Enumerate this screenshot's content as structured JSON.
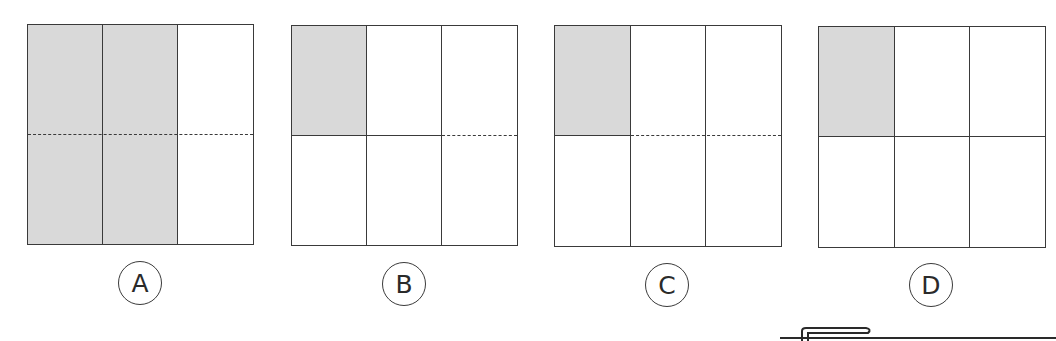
{
  "colors": {
    "line": "#3a3a3a",
    "shade": "#d9d9d9",
    "background": "#ffffff"
  },
  "options": [
    {
      "label": "A",
      "columns": 3,
      "rows": 2,
      "shaded_cells": [
        [
          0,
          0
        ],
        [
          0,
          1
        ],
        [
          1,
          0
        ],
        [
          1,
          1
        ]
      ],
      "horizontal_divider": [
        "dashed",
        "dashed",
        "dashed"
      ],
      "description": "Two of three columns shaded; dashed horizontal line across all columns"
    },
    {
      "label": "B",
      "columns": 3,
      "rows": 2,
      "shaded_cells": [
        [
          0,
          0
        ]
      ],
      "horizontal_divider": [
        "solid",
        "solid",
        "dashed"
      ],
      "description": "Top-left cell shaded; solid divider in first two columns, dashed in third"
    },
    {
      "label": "C",
      "columns": 3,
      "rows": 2,
      "shaded_cells": [
        [
          0,
          0
        ]
      ],
      "horizontal_divider": [
        "solid",
        "dashed",
        "dashed"
      ],
      "description": "Top-left cell shaded; solid divider in first column, dashed in second and third"
    },
    {
      "label": "D",
      "columns": 3,
      "rows": 2,
      "shaded_cells": [
        [
          0,
          0
        ]
      ],
      "horizontal_divider": [
        "solid",
        "solid",
        "solid"
      ],
      "description": "Top-left cell shaded; solid divider across all columns"
    }
  ]
}
